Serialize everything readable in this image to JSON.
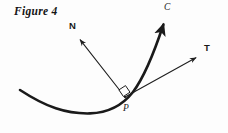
{
  "figure": {
    "caption": "Figure 4",
    "background_color": "#fdfdfd",
    "ink_color": "#1a1a1a",
    "width": 228,
    "height": 133
  },
  "labels": {
    "curve": "C",
    "normal_vector": "N",
    "tangent_vector": "T",
    "point": "P"
  },
  "geometry": {
    "point_P": {
      "x": 125,
      "y": 97
    },
    "curve": {
      "name": "curve-C",
      "start": {
        "x": 20,
        "y": 90
      },
      "control_1": {
        "x": 62,
        "y": 120
      },
      "control_2": {
        "x": 118,
        "y": 112
      },
      "vertex_region": {
        "x": 90,
        "y": 113
      },
      "control_3": {
        "x": 143,
        "y": 82
      },
      "control_4": {
        "x": 160,
        "y": 48
      },
      "arrow_tip": {
        "x": 166,
        "y": 19
      },
      "stroke_width": 2.6
    },
    "normal_arrow": {
      "name": "vector-N",
      "from": {
        "x": 125,
        "y": 97
      },
      "to": {
        "x": 78,
        "y": 37
      },
      "stroke_width": 1.1
    },
    "tangent_arrow": {
      "name": "vector-T",
      "from": {
        "x": 125,
        "y": 97
      },
      "to": {
        "x": 199,
        "y": 56
      },
      "stroke_width": 1.1
    },
    "right_angle_mark": {
      "name": "right-angle-square",
      "size": 9,
      "corner": {
        "x": 125,
        "y": 97
      }
    }
  }
}
